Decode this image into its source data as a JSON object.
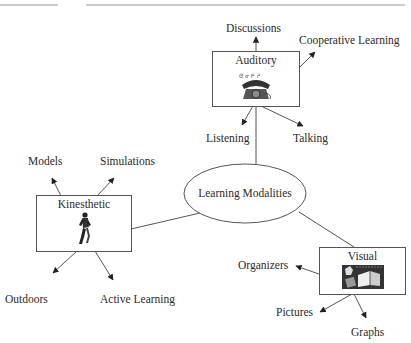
{
  "diagram": {
    "center": {
      "label": "Learning Modalities"
    },
    "nodes": [
      {
        "id": "auditory",
        "label": "Auditory",
        "icon": "telephone-icon",
        "children": [
          "Discussions",
          "Cooperative Learning",
          "Listening",
          "Talking"
        ]
      },
      {
        "id": "kinesthetic",
        "label": "Kinesthetic",
        "icon": "runner-icon",
        "children": [
          "Models",
          "Simulations",
          "Outdoors",
          "Active Learning"
        ]
      },
      {
        "id": "visual",
        "label": "Visual",
        "icon": "books-picture-icon",
        "children": [
          "Organizers",
          "Pictures",
          "Graphs"
        ]
      }
    ]
  },
  "labels": {
    "center": "Learning Modalities",
    "auditory": "Auditory",
    "kinesthetic": "Kinesthetic",
    "visual": "Visual",
    "discussions": "Discussions",
    "cooperative_learning": "Cooperative Learning",
    "listening": "Listening",
    "talking": "Talking",
    "models": "Models",
    "simulations": "Simulations",
    "outdoors": "Outdoors",
    "active_learning": "Active Learning",
    "organizers": "Organizers",
    "pictures": "Pictures",
    "graphs": "Graphs"
  }
}
